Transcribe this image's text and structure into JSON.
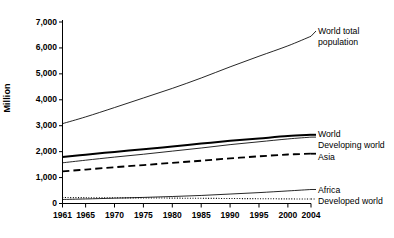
{
  "chart_data": {
    "type": "line",
    "title": "",
    "subtitle": "",
    "xlabel": "",
    "ylabel": "Million",
    "xlim": [
      1961,
      2004
    ],
    "ylim": [
      0,
      7000
    ],
    "grid": false,
    "legend_position": "right-inline",
    "x_ticks": [
      "1961",
      "1965",
      "1970",
      "1975",
      "1980",
      "1985",
      "1990",
      "1995",
      "2000",
      "2004"
    ],
    "x_tick_values": [
      1961,
      1965,
      1970,
      1975,
      1980,
      1985,
      1990,
      1995,
      2000,
      2004
    ],
    "y_ticks": [
      "0",
      "1,000",
      "2,000",
      "3,000",
      "4,000",
      "5,000",
      "6,000",
      "7,000"
    ],
    "y_tick_values": [
      0,
      1000,
      2000,
      3000,
      4000,
      5000,
      6000,
      7000
    ],
    "x": [
      1961,
      1965,
      1970,
      1975,
      1980,
      1985,
      1990,
      1995,
      2000,
      2004
    ],
    "series": [
      {
        "name": "World total population",
        "style": "thin-solid",
        "color": "#000000",
        "values": [
          3080,
          3340,
          3700,
          4070,
          4440,
          4840,
          5270,
          5680,
          6080,
          6450
        ]
      },
      {
        "name": "World",
        "style": "bold-solid",
        "color": "#000000",
        "values": [
          1790,
          1880,
          1990,
          2090,
          2200,
          2310,
          2420,
          2510,
          2600,
          2650
        ]
      },
      {
        "name": "Developing world",
        "style": "thin-solid",
        "color": "#000000",
        "values": [
          1570,
          1670,
          1790,
          1900,
          2020,
          2140,
          2270,
          2380,
          2490,
          2560
        ]
      },
      {
        "name": "Asia",
        "style": "dashed",
        "color": "#000000",
        "values": [
          1240,
          1310,
          1400,
          1480,
          1570,
          1650,
          1740,
          1820,
          1890,
          1920
        ]
      },
      {
        "name": "Africa",
        "style": "thin-solid",
        "color": "#000000",
        "values": [
          155,
          175,
          205,
          235,
          270,
          310,
          365,
          420,
          485,
          540
        ]
      },
      {
        "name": "Developed world",
        "style": "dotted",
        "color": "#000000",
        "values": [
          230,
          225,
          220,
          215,
          208,
          200,
          193,
          185,
          178,
          172
        ]
      }
    ],
    "annotations": [
      {
        "text": "World total\npopulation",
        "series": "World total population"
      },
      {
        "text": "World",
        "series": "World"
      },
      {
        "text": "Developing world",
        "series": "Developing world"
      },
      {
        "text": "Asia",
        "series": "Asia"
      },
      {
        "text": "Africa",
        "series": "Africa"
      },
      {
        "text": "Developed world",
        "series": "Developed world"
      }
    ]
  }
}
